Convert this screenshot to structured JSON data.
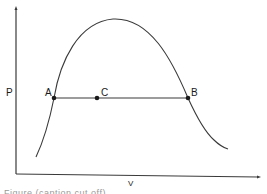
{
  "diagram": {
    "type": "pv-diagram",
    "axes": {
      "y_label": "P",
      "x_label": "V"
    },
    "points": [
      {
        "id": "A",
        "label": "A",
        "x": 54,
        "y": 98
      },
      {
        "id": "C",
        "label": "C",
        "x": 97,
        "y": 98
      },
      {
        "id": "B",
        "label": "B",
        "x": 188,
        "y": 98
      }
    ],
    "curve": "dome-shaped coexistence curve",
    "tie_line": "horizontal line from A through C to B",
    "caption_partial": "Figure (caption cut off)"
  },
  "colors": {
    "line": "#3a3a3a",
    "background": "#ffffff"
  }
}
